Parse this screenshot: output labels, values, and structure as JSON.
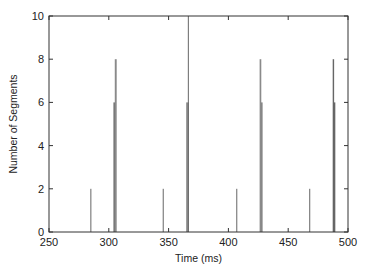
{
  "chart_data": {
    "type": "bar",
    "title": "",
    "xlabel": "Time (ms)",
    "ylabel": "Number of Segments",
    "xlim": [
      250,
      500
    ],
    "ylim": [
      0,
      10
    ],
    "xticks": [
      250,
      300,
      350,
      400,
      450,
      500
    ],
    "yticks": [
      0,
      2,
      4,
      6,
      8,
      10
    ],
    "grid": false,
    "legend": null,
    "bars": [
      {
        "x": 285,
        "y": 2,
        "width": 0.6
      },
      {
        "x": 304.5,
        "y": 6,
        "width": 1.2
      },
      {
        "x": 305.8,
        "y": 8,
        "width": 1.6
      },
      {
        "x": 345.5,
        "y": 2,
        "width": 0.6
      },
      {
        "x": 365.8,
        "y": 6,
        "width": 2.2
      },
      {
        "x": 366.5,
        "y": 10,
        "width": 0.7
      },
      {
        "x": 407,
        "y": 2,
        "width": 0.6
      },
      {
        "x": 426.8,
        "y": 8,
        "width": 1.4
      },
      {
        "x": 428,
        "y": 6,
        "width": 1.0
      },
      {
        "x": 468,
        "y": 2,
        "width": 0.6
      },
      {
        "x": 487.8,
        "y": 8,
        "width": 1.2
      },
      {
        "x": 488.8,
        "y": 6,
        "width": 1.2
      }
    ],
    "colors": {
      "bar": "#8a8a8a",
      "thin_bar": "#666666",
      "axis": "#333333"
    }
  }
}
